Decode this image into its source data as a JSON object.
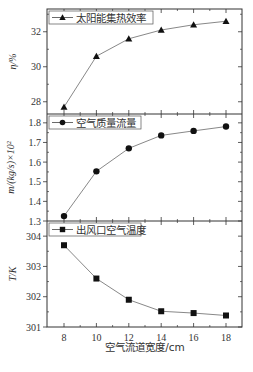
{
  "chart_data": {
    "type": "line",
    "layout": "3 vertically stacked panels sharing x-axis",
    "xlabel": "空气流道宽度/cm",
    "x": [
      8,
      10,
      12,
      14,
      16,
      18
    ],
    "x_ticks": [
      "8",
      "10",
      "12",
      "14",
      "16",
      "18"
    ],
    "xlim": [
      7,
      19
    ],
    "panels": [
      {
        "name": "efficiency",
        "legend": "太阳能集热效率",
        "marker": "triangle",
        "ylabel": "η/%",
        "ylim": [
          27.3,
          33.3
        ],
        "y_ticks": [
          28,
          30,
          32
        ],
        "values": [
          27.7,
          30.6,
          31.6,
          32.1,
          32.4,
          32.6
        ]
      },
      {
        "name": "mass-flow",
        "legend": "空气质量流量",
        "marker": "circle",
        "ylabel": "m/(kg/s)×10²",
        "ylim": [
          1.3,
          1.845
        ],
        "y_ticks": [
          1.3,
          1.4,
          1.5,
          1.6,
          1.7,
          1.8
        ],
        "values": [
          1.325,
          1.553,
          1.67,
          1.736,
          1.759,
          1.781
        ]
      },
      {
        "name": "outlet-temperature",
        "legend": "出风口空气温度",
        "marker": "square",
        "ylabel": "T/K",
        "ylim": [
          301,
          304.5
        ],
        "y_ticks": [
          301,
          302,
          303,
          304
        ],
        "values": [
          303.7,
          302.6,
          301.9,
          301.52,
          301.46,
          301.38
        ]
      }
    ],
    "grid": false,
    "legend_position": "upper left of each panel",
    "line_color": "#888888",
    "marker_color": "#111111"
  }
}
